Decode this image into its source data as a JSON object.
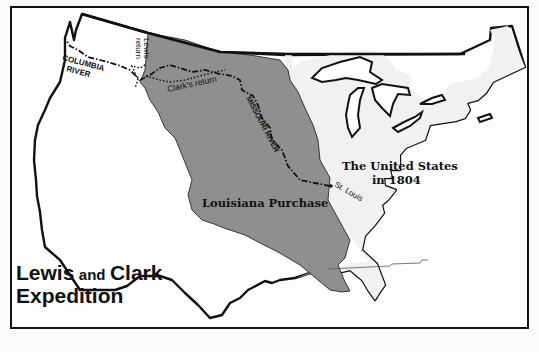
{
  "map": {
    "title": {
      "line1_a": "Lewis",
      "line1_b": "and",
      "line1_c": "Clark",
      "line2": "Expedition"
    },
    "regions": {
      "louisiana": "Louisiana Purchase",
      "us_line1": "The United States",
      "us_line2": "in 1804"
    },
    "labels": {
      "columbia_1": "COLUMBIA",
      "columbia_2": "RIVER",
      "lewis_1": "Lewis",
      "lewis_2": "return",
      "clark_return": "Clark's return",
      "missouri": "MISSOURI RIVER",
      "st_louis": "St. Louis"
    },
    "colors": {
      "louisiana_fill": "#8f8f8f",
      "us_fill": "#f1f1f1",
      "land_fill": "#ffffff",
      "border": "#111111",
      "background": "#fbfbfb"
    }
  }
}
